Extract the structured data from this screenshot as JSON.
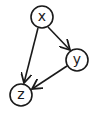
{
  "diagram": {
    "type": "directed-graph",
    "nodes": [
      {
        "id": "x",
        "label": "x",
        "cx": 42,
        "cy": 17,
        "r": 11
      },
      {
        "id": "y",
        "label": "y",
        "cx": 77,
        "cy": 60,
        "r": 11
      },
      {
        "id": "z",
        "label": "z",
        "cx": 21,
        "cy": 95,
        "r": 11
      }
    ],
    "edges": [
      {
        "from": "x",
        "to": "y"
      },
      {
        "from": "x",
        "to": "z"
      },
      {
        "from": "y",
        "to": "z"
      }
    ],
    "colors": {
      "stroke": "#1a1a1a",
      "background": "#ffffff"
    }
  }
}
